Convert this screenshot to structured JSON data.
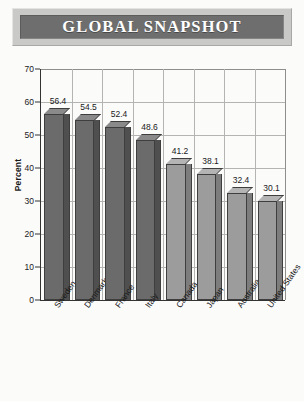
{
  "banner": {
    "title": "GLOBAL SNAPSHOT",
    "frame_color": "#c9c9c7",
    "bar_color": "#6e6e6e",
    "text_color": "#ffffff"
  },
  "chart_data": {
    "type": "bar",
    "title": "GLOBAL SNAPSHOT",
    "xlabel": "",
    "ylabel": "Percent",
    "ylim": [
      0,
      70
    ],
    "yticks": [
      0,
      10,
      20,
      30,
      40,
      50,
      60,
      70
    ],
    "grid": true,
    "legend": null,
    "categories": [
      "Sweden",
      "Denmark",
      "France",
      "Italy",
      "Canada",
      "Japan",
      "Australia",
      "United States"
    ],
    "values": [
      56.4,
      54.5,
      52.4,
      48.6,
      41.2,
      38.1,
      32.4,
      30.1
    ],
    "data_labels": [
      "56.4",
      "54.5",
      "52.4",
      "48.6",
      "41.2",
      "38.1",
      "32.4",
      "30.1"
    ],
    "bar_colors": [
      "#6b6b6b",
      "#6b6b6b",
      "#6b6b6b",
      "#6b6b6b",
      "#9c9c9c",
      "#9c9c9c",
      "#9c9c9c",
      "#9c9c9c"
    ],
    "bar_side_colors": [
      "#4f4f4f",
      "#4f4f4f",
      "#4f4f4f",
      "#4f4f4f",
      "#7d7d7d",
      "#7d7d7d",
      "#7d7d7d",
      "#7d7d7d"
    ],
    "bar_top_colors": [
      "#8a8a8a",
      "#8a8a8a",
      "#8a8a8a",
      "#8a8a8a",
      "#b4b4b4",
      "#b4b4b4",
      "#b4b4b4",
      "#b4b4b4"
    ]
  }
}
